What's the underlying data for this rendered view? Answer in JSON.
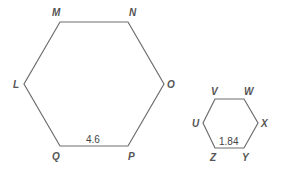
{
  "diagram": {
    "hexagon_large": {
      "vertices": [
        "M",
        "N",
        "O",
        "P",
        "Q",
        "L"
      ],
      "side_label": "4.6",
      "side": "QP"
    },
    "hexagon_small": {
      "vertices": [
        "V",
        "W",
        "X",
        "Y",
        "Z",
        "U"
      ],
      "side_label": "1.84",
      "side": "ZY"
    }
  }
}
